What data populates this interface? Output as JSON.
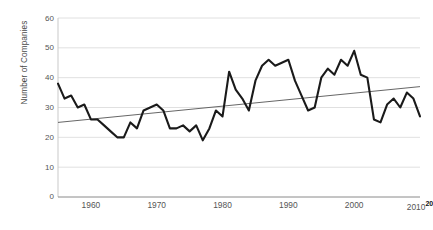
{
  "chart_data": {
    "type": "line",
    "title": "",
    "xlabel": "",
    "ylabel": "Number of Companies",
    "xlim": [
      1955,
      2010
    ],
    "ylim": [
      0,
      60
    ],
    "xticks": [
      1960,
      1970,
      1980,
      1990,
      2000,
      2010
    ],
    "yticks": [
      0,
      10,
      20,
      30,
      40,
      50,
      60
    ],
    "grid": "horizontal",
    "legend": "none",
    "series": [
      {
        "name": "Number of Companies",
        "color": "#1a1a1a",
        "x": [
          1955,
          1956,
          1957,
          1958,
          1959,
          1960,
          1961,
          1962,
          1963,
          1964,
          1965,
          1966,
          1967,
          1968,
          1969,
          1970,
          1971,
          1972,
          1973,
          1974,
          1975,
          1976,
          1977,
          1978,
          1979,
          1980,
          1981,
          1982,
          1983,
          1984,
          1985,
          1986,
          1987,
          1988,
          1989,
          1990,
          1991,
          1992,
          1993,
          1994,
          1995,
          1996,
          1997,
          1998,
          1999,
          2000,
          2001,
          2002,
          2003,
          2004,
          2005,
          2006,
          2007,
          2008,
          2009,
          2010
        ],
        "values": [
          38,
          33,
          34,
          30,
          31,
          26,
          26,
          24,
          22,
          20,
          20,
          25,
          23,
          29,
          30,
          31,
          29,
          23,
          23,
          24,
          22,
          24,
          19,
          23,
          29,
          27,
          42,
          36,
          33,
          29,
          39,
          44,
          46,
          44,
          45,
          46,
          39,
          34,
          29,
          30,
          40,
          43,
          41,
          46,
          44,
          49,
          41,
          40,
          26,
          25,
          31,
          33,
          30,
          35,
          33,
          27
        ]
      },
      {
        "name": "Linear trend",
        "color": "#555555",
        "x": [
          1955,
          2010
        ],
        "values": [
          25.0,
          37.0
        ]
      }
    ],
    "axis_overflow_label": "20"
  },
  "axes": {
    "y_title": "Number of Companies",
    "y_tick_labels": [
      "60",
      "50",
      "40",
      "30",
      "20",
      "10",
      "0"
    ],
    "x_tick_labels": [
      "1960",
      "1970",
      "1980",
      "1990",
      "2000",
      "2010"
    ],
    "x_last_tick_suffix": "20"
  }
}
